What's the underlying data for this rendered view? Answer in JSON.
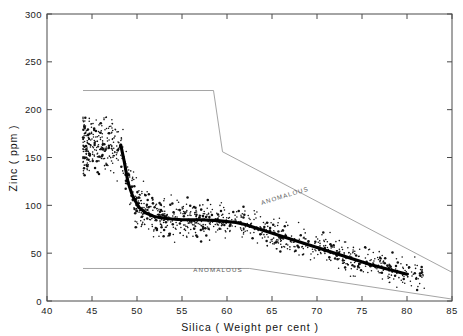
{
  "figure": {
    "background": "#ffffff",
    "ink_color": "#111111",
    "envelope_color": "#8d8d8d",
    "trend_color": "#000000"
  },
  "chart_data": {
    "type": "scatter",
    "title": "",
    "subtitle": "",
    "xlabel": "Silica ( Weight per cent )",
    "ylabel": "Zinc ( ppm )",
    "xlim": [
      40,
      85
    ],
    "ylim": [
      0,
      300
    ],
    "xticks": [
      40,
      45,
      50,
      55,
      60,
      65,
      70,
      75,
      80,
      85
    ],
    "yticks": [
      0,
      50,
      100,
      150,
      200,
      250,
      300
    ],
    "xtick_labels": [
      "40",
      "45",
      "50",
      "55",
      "60",
      "65",
      "70",
      "75",
      "80",
      "85"
    ],
    "ytick_labels": [
      "0",
      "50",
      "100",
      "150",
      "200",
      "250",
      "300"
    ],
    "grid": false,
    "legend_position": "none",
    "annotations": [
      {
        "text": "ANOMALOUS",
        "x": 66.5,
        "y": 108,
        "rotation": -17,
        "name": "upper-anomalous-label"
      },
      {
        "text": "ANOMALOUS",
        "x": 59.0,
        "y": 30,
        "rotation": 0,
        "name": "lower-anomalous-label"
      }
    ],
    "series": [
      {
        "name": "Upper threshold envelope",
        "type": "line",
        "x": [
          44.0,
          58.5,
          59.5,
          85.0
        ],
        "values": [
          220,
          220,
          156,
          30
        ]
      },
      {
        "name": "Lower threshold envelope",
        "type": "line",
        "x": [
          44.0,
          62.5,
          85.0
        ],
        "values": [
          34,
          34,
          2
        ]
      },
      {
        "name": "Median trend (moving average)",
        "type": "line",
        "x": [
          48.2,
          48.6,
          49.0,
          49.5,
          50.2,
          51.0,
          52.0,
          53.5,
          55.0,
          57.0,
          59.0,
          61.0,
          62.0,
          64.0,
          66.0,
          68.0,
          70.0,
          72.0,
          74.0,
          76.0,
          78.0,
          80.0
        ],
        "values": [
          163,
          145,
          124,
          110,
          98,
          92,
          88,
          86,
          85,
          85,
          84,
          82,
          80,
          74,
          68,
          62,
          56,
          50,
          44,
          38,
          33,
          28
        ]
      },
      {
        "name": "Stream sediment samples",
        "type": "scatter",
        "point_count": 1200,
        "x_range": [
          44,
          82
        ],
        "y_range": [
          5,
          225
        ]
      }
    ]
  },
  "axis": {
    "x_title": "Silica ( Weight per cent )",
    "y_title": "Zinc ( ppm )"
  }
}
